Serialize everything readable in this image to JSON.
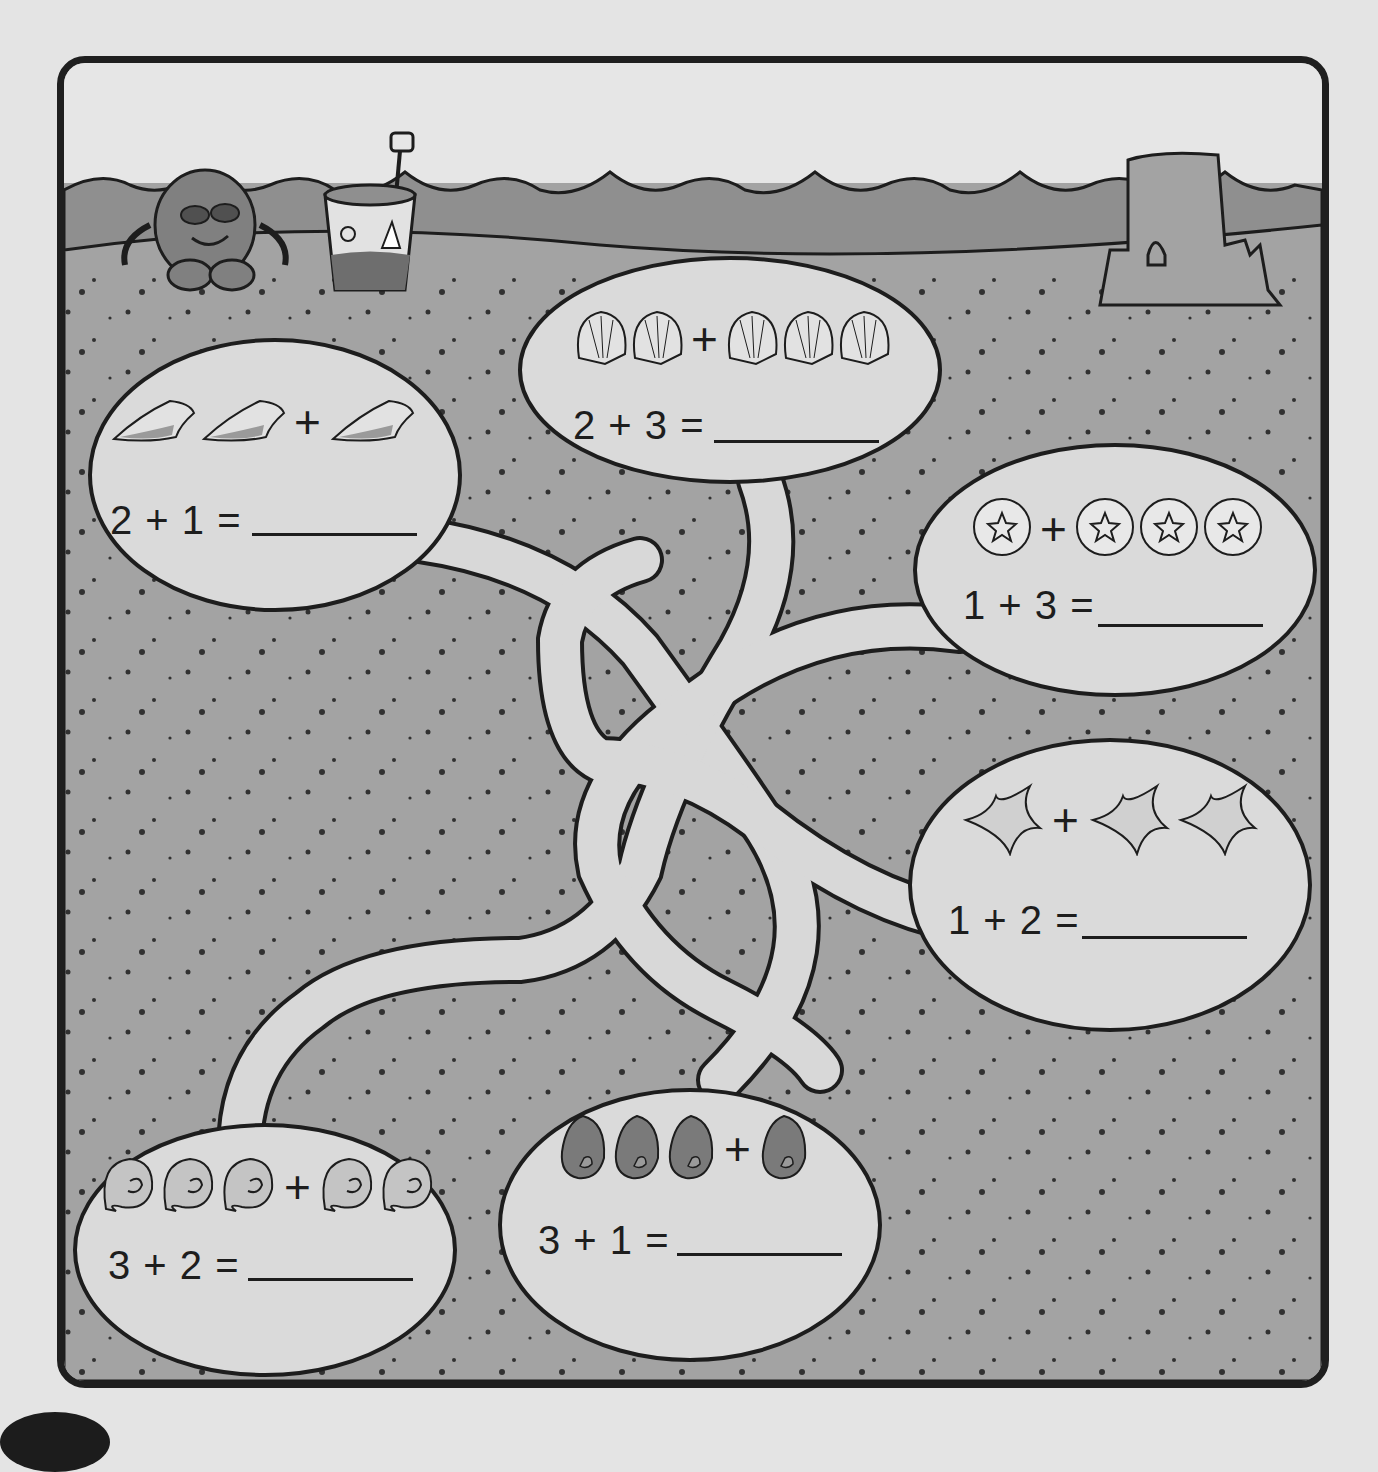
{
  "worksheet": {
    "title": "Beach addition maze",
    "scene": {
      "top_left": [
        "crab-with-sunglasses",
        "sand-bucket-with-shovel"
      ],
      "top_right": [
        "sandcastle"
      ],
      "background": "sandy beach with waves"
    },
    "colors": {
      "paper": "#e4e4e4",
      "sand": "#a3a3a3",
      "water": "#8f8f8f",
      "sky": "#e6e6e6",
      "bubble": "#dadada",
      "path": "#d8d8d8",
      "ink": "#1d1d1d"
    },
    "problems": [
      {
        "id": "conch",
        "item_icon": "conch-shell-icon",
        "left_count": 2,
        "right_count": 1,
        "equation": "2 + 1 =",
        "plus": "+",
        "answer": ""
      },
      {
        "id": "scallop",
        "item_icon": "scallop-shell-icon",
        "left_count": 2,
        "right_count": 3,
        "equation": "2 + 3 =",
        "plus": "+",
        "answer": ""
      },
      {
        "id": "sand-dollar",
        "item_icon": "sand-dollar-icon",
        "left_count": 1,
        "right_count": 3,
        "equation": "1 + 3 =",
        "plus": "+",
        "answer": ""
      },
      {
        "id": "starfish",
        "item_icon": "starfish-icon",
        "left_count": 1,
        "right_count": 2,
        "equation": "1 + 2 =",
        "plus": "+",
        "answer": ""
      },
      {
        "id": "mussel",
        "item_icon": "mussel-shell-icon",
        "left_count": 3,
        "right_count": 1,
        "equation": "3 + 1 =",
        "plus": "+",
        "answer": ""
      },
      {
        "id": "nautilus",
        "item_icon": "spiral-shell-icon",
        "left_count": 3,
        "right_count": 2,
        "equation": "3 + 2 =",
        "plus": "+",
        "answer": ""
      }
    ]
  }
}
